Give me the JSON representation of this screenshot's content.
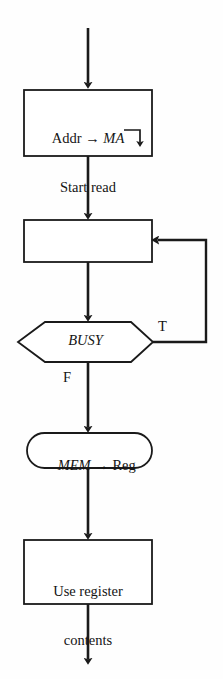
{
  "diagram": {
    "stroke_color": "#1a1a1a",
    "background_color": "#fefefe",
    "nodes": {
      "process_addr": {
        "shape": "rectangle",
        "line1_prefix": "Addr → ",
        "line1_italic": "MA",
        "line2": "Start read"
      },
      "process_wait": {
        "shape": "rectangle",
        "text": ""
      },
      "decision_busy": {
        "shape": "hexagon",
        "text": "BUSY"
      },
      "terminal_mem": {
        "shape": "rounded-rectangle",
        "italic_part": "MEM",
        "rest": " → Reg"
      },
      "process_use": {
        "shape": "rectangle",
        "line1": "Use register",
        "line2": "contents"
      }
    },
    "branches": {
      "true_label": "T",
      "false_label": "F"
    }
  }
}
